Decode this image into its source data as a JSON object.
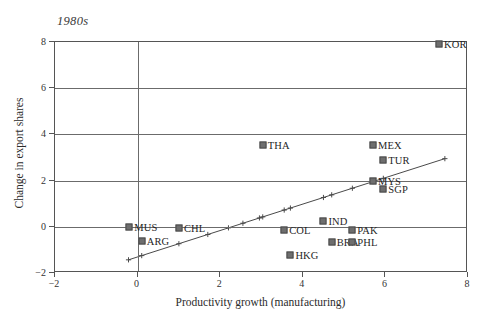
{
  "chart_data": {
    "type": "scatter",
    "title": "1980s",
    "xlabel": "Productivity growth (manufacturing)",
    "ylabel": "Change in export shares",
    "xlim": [
      -2,
      8
    ],
    "ylim": [
      -2,
      8
    ],
    "xticks": [
      -2,
      0,
      2,
      4,
      6,
      8
    ],
    "yticks": [
      -2,
      0,
      2,
      4,
      6,
      8
    ],
    "xticklabels": [
      "−2",
      "0",
      "2",
      "4",
      "6",
      "8"
    ],
    "yticklabels": [
      "−2",
      "0",
      "2",
      "4",
      "6",
      "8"
    ],
    "grid": "horizontal gridlines at each y tick plus vertical line at x=0",
    "legend": "none",
    "points": [
      {
        "label": "KOR",
        "x": 7.3,
        "y": 7.9,
        "label_pos": "right"
      },
      {
        "label": "THA",
        "x": 3.03,
        "y": 3.55,
        "label_pos": "right"
      },
      {
        "label": "MEX",
        "x": 5.7,
        "y": 3.55,
        "label_pos": "right"
      },
      {
        "label": "TUR",
        "x": 5.95,
        "y": 2.9,
        "label_pos": "right"
      },
      {
        "label": "MYS",
        "x": 5.7,
        "y": 2.0,
        "label_pos": "right"
      },
      {
        "label": "SGP",
        "x": 5.95,
        "y": 1.65,
        "label_pos": "right"
      },
      {
        "label": "IND",
        "x": 4.5,
        "y": 0.25,
        "label_pos": "right"
      },
      {
        "label": "MUS",
        "x": -0.2,
        "y": 0.0,
        "label_pos": "right"
      },
      {
        "label": "CHL",
        "x": 1.0,
        "y": -0.05,
        "label_pos": "right"
      },
      {
        "label": "PAK",
        "x": 5.2,
        "y": -0.15,
        "label_pos": "right"
      },
      {
        "label": "COL",
        "x": 3.55,
        "y": -0.15,
        "label_pos": "right"
      },
      {
        "label": "ARG",
        "x": 0.1,
        "y": -0.6,
        "label_pos": "right"
      },
      {
        "label": "BRA",
        "x": 4.7,
        "y": -0.65,
        "label_pos": "right"
      },
      {
        "label": "PHL",
        "x": 5.2,
        "y": -0.65,
        "label_pos": "right"
      },
      {
        "label": "HKG",
        "x": 3.7,
        "y": -1.2,
        "label_pos": "right"
      }
    ],
    "fit_line": {
      "description": "upward-sloping regression line with small plus-shaped fitted-value markers",
      "x_start": -0.22,
      "y_start": -1.43,
      "x_end": 7.44,
      "y_end": 2.95,
      "marker": "plus",
      "marker_x": [
        -0.22,
        0.1,
        1.0,
        1.7,
        2.2,
        2.55,
        2.95,
        3.03,
        3.55,
        3.7,
        4.5,
        4.7,
        5.2,
        5.7,
        5.95,
        7.44
      ]
    }
  }
}
